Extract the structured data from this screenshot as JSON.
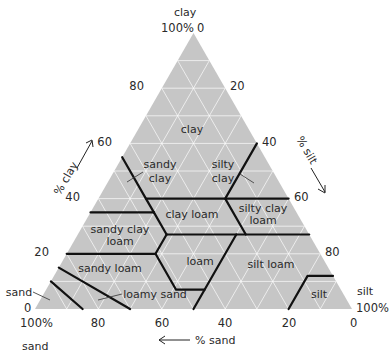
{
  "diagram": {
    "type": "ternary soil texture triangle",
    "vertices": {
      "top": {
        "name": "clay",
        "pct": "100%",
        "tick": "0"
      },
      "left": {
        "name": "sand",
        "pct": "100%",
        "tick": "0"
      },
      "right": {
        "name": "silt",
        "pct": "100%",
        "tick": "0"
      }
    },
    "axes": {
      "clay": {
        "title": "% clay",
        "ticks": [
          "20",
          "40",
          "60",
          "80"
        ]
      },
      "silt": {
        "title": "% silt",
        "ticks": [
          "20",
          "40",
          "60",
          "80"
        ]
      },
      "sand": {
        "title": "% sand",
        "ticks": [
          "80",
          "60",
          "40",
          "20"
        ]
      }
    },
    "colors": {
      "fill": "#c6c6c6",
      "grid": "#ffffff",
      "boundary": "#111111",
      "text": "#2a2a2a"
    },
    "regions": [
      {
        "name": "clay",
        "lines": [
          "clay"
        ]
      },
      {
        "name": "sandy clay",
        "lines": [
          "sandy",
          "clay"
        ]
      },
      {
        "name": "silty clay",
        "lines": [
          "silty",
          "clay"
        ]
      },
      {
        "name": "clay loam",
        "lines": [
          "clay loam"
        ]
      },
      {
        "name": "silty clay loam",
        "lines": [
          "silty clay",
          "loam"
        ]
      },
      {
        "name": "sandy clay loam",
        "lines": [
          "sandy clay",
          "loam"
        ]
      },
      {
        "name": "loam",
        "lines": [
          "loam"
        ]
      },
      {
        "name": "silt loam",
        "lines": [
          "silt loam"
        ]
      },
      {
        "name": "sandy loam",
        "lines": [
          "sandy loam"
        ]
      },
      {
        "name": "loamy sand",
        "lines": [
          "loamy sand"
        ]
      },
      {
        "name": "sand",
        "lines": [
          "sand"
        ]
      },
      {
        "name": "silt",
        "lines": [
          "silt"
        ]
      }
    ]
  }
}
